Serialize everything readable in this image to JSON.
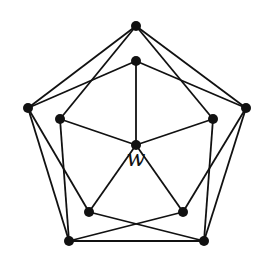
{
  "diagram": {
    "type": "graph",
    "colors": {
      "edge": "#111111",
      "node": "#111111",
      "background": "#ffffff"
    },
    "label": {
      "text": "w",
      "node": "c",
      "x": 136,
      "y": 166
    },
    "nodes": [
      {
        "id": "ot",
        "x": 136,
        "y": 26
      },
      {
        "id": "it",
        "x": 136,
        "y": 61
      },
      {
        "id": "ol",
        "x": 28,
        "y": 108
      },
      {
        "id": "or",
        "x": 246,
        "y": 108
      },
      {
        "id": "il",
        "x": 60,
        "y": 119
      },
      {
        "id": "ir",
        "x": 213,
        "y": 119
      },
      {
        "id": "c",
        "x": 136,
        "y": 145
      },
      {
        "id": "ibl",
        "x": 89,
        "y": 212
      },
      {
        "id": "ibr",
        "x": 183,
        "y": 212
      },
      {
        "id": "obl",
        "x": 69,
        "y": 241
      },
      {
        "id": "obr",
        "x": 204,
        "y": 241
      }
    ],
    "edges": [
      [
        "ot",
        "ol"
      ],
      [
        "ot",
        "or"
      ],
      [
        "ot",
        "il"
      ],
      [
        "ot",
        "ir"
      ],
      [
        "it",
        "ol"
      ],
      [
        "it",
        "or"
      ],
      [
        "it",
        "c"
      ],
      [
        "ol",
        "ibl"
      ],
      [
        "ol",
        "obl"
      ],
      [
        "or",
        "ibr"
      ],
      [
        "or",
        "obr"
      ],
      [
        "il",
        "c"
      ],
      [
        "il",
        "obl"
      ],
      [
        "ir",
        "c"
      ],
      [
        "ir",
        "obr"
      ],
      [
        "c",
        "ibl"
      ],
      [
        "c",
        "ibr"
      ],
      [
        "ibl",
        "obr"
      ],
      [
        "ibr",
        "obl"
      ],
      [
        "obl",
        "obr"
      ]
    ]
  }
}
